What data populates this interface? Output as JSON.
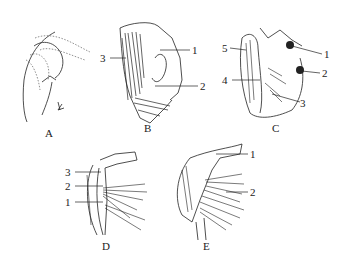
{
  "figure": {
    "panels": [
      {
        "id": "A",
        "label": "A",
        "callouts": []
      },
      {
        "id": "B",
        "label": "B",
        "callouts": [
          "1",
          "2",
          "3"
        ]
      },
      {
        "id": "C",
        "label": "C",
        "callouts": [
          "1",
          "2",
          "3",
          "4",
          "5"
        ]
      },
      {
        "id": "D",
        "label": "D",
        "callouts": [
          "1",
          "2",
          "3"
        ]
      },
      {
        "id": "E",
        "label": "E",
        "callouts": [
          "1",
          "2"
        ]
      }
    ],
    "colors": {
      "ink": "#222222",
      "background": "#ffffff"
    }
  }
}
